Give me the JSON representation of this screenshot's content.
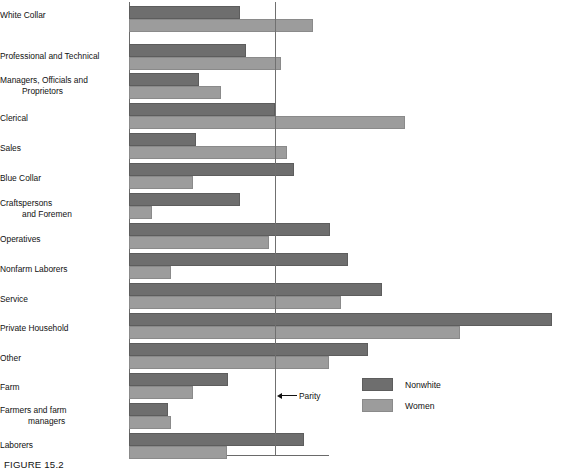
{
  "figure": {
    "caption": "FIGURE 15.2",
    "parity_label": "Parity"
  },
  "legend": {
    "items": [
      {
        "key": "nonwhite",
        "label": "Nonwhite",
        "color": "#6e6e6e"
      },
      {
        "key": "women",
        "label": "Women",
        "color": "#9c9c9c"
      }
    ]
  },
  "chart_data": {
    "type": "bar",
    "orientation": "horizontal",
    "title": "FIGURE 15.2",
    "xlabel": "",
    "ylabel": "",
    "grid": false,
    "legend_position": "bottom-right",
    "reference_line": {
      "label": "Parity",
      "value": 1.0
    },
    "xlim": [
      0,
      3.0
    ],
    "categories": [
      "White Collar",
      "Professional and Technical",
      "Managers, Officials and Proprietors",
      "Clerical",
      "Sales",
      "Blue Collar",
      "Craftspersons and Foremen",
      "Operatives",
      "Nonfarm Laborers",
      "Service",
      "Private Household",
      "Other",
      "Farm",
      "Farmers and farm managers",
      "Laborers"
    ],
    "category_lines": [
      [
        "White Collar"
      ],
      [
        "Professional and Technical"
      ],
      [
        "Managers, Officials and",
        "Proprietors"
      ],
      [
        "Clerical"
      ],
      [
        "Sales"
      ],
      [
        "Blue Collar"
      ],
      [
        "Craftspersons",
        "and Foremen"
      ],
      [
        "Operatives"
      ],
      [
        "Nonfarm Laborers"
      ],
      [
        "Service"
      ],
      [
        "Private Household"
      ],
      [
        "Other"
      ],
      [
        "Farm"
      ],
      [
        "Farmers and farm",
        "managers"
      ],
      [
        "Laborers"
      ]
    ],
    "series": [
      {
        "name": "Nonwhite",
        "color": "#6e6e6e",
        "values": [
          0.76,
          0.8,
          0.48,
          1.0,
          0.46,
          1.13,
          0.76,
          1.38,
          1.5,
          1.73,
          2.9,
          1.64,
          0.68,
          0.27,
          1.2
        ]
      },
      {
        "name": "Women",
        "color": "#9c9c9c",
        "values": [
          1.26,
          1.04,
          0.63,
          1.89,
          1.08,
          0.44,
          0.16,
          0.96,
          0.29,
          1.45,
          2.27,
          1.37,
          0.44,
          0.29,
          0.67
        ]
      }
    ]
  }
}
